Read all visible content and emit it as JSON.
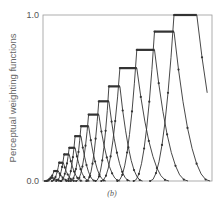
{
  "chart_data": {
    "type": "line",
    "title": "",
    "caption": "(b)",
    "xlabel": "",
    "ylabel": "Perceptual weighting functions",
    "ylim": [
      0.0,
      1.0
    ],
    "y_ticks": [
      "0.0",
      "1.0"
    ],
    "x_ticks": [],
    "grid": false,
    "legend": null,
    "series_description": "Family of 14 peaked weighting functions, each with a flat-top plateau, rising sharply on the left and decaying on the right; peak height increases with position",
    "series": [
      {
        "name": "band-1",
        "plateau": [
          0.045,
          0.06
        ],
        "peak": 0.02
      },
      {
        "name": "band-2",
        "plateau": [
          0.065,
          0.09
        ],
        "peak": 0.06
      },
      {
        "name": "band-3",
        "plateau": [
          0.095,
          0.12
        ],
        "peak": 0.11
      },
      {
        "name": "band-4",
        "plateau": [
          0.125,
          0.155
        ],
        "peak": 0.16
      },
      {
        "name": "band-5",
        "plateau": [
          0.155,
          0.19
        ],
        "peak": 0.2
      },
      {
        "name": "band-6",
        "plateau": [
          0.19,
          0.225
        ],
        "peak": 0.27
      },
      {
        "name": "band-7",
        "plateau": [
          0.225,
          0.27
        ],
        "peak": 0.33
      },
      {
        "name": "band-8",
        "plateau": [
          0.27,
          0.33
        ],
        "peak": 0.4
      },
      {
        "name": "band-9",
        "plateau": [
          0.33,
          0.39
        ],
        "peak": 0.48
      },
      {
        "name": "band-10",
        "plateau": [
          0.39,
          0.455
        ],
        "peak": 0.57
      },
      {
        "name": "band-11",
        "plateau": [
          0.455,
          0.555
        ],
        "peak": 0.68
      },
      {
        "name": "band-12",
        "plateau": [
          0.555,
          0.66
        ],
        "peak": 0.79
      },
      {
        "name": "band-13",
        "plateau": [
          0.66,
          0.775
        ],
        "peak": 0.9
      },
      {
        "name": "band-14",
        "plateau": [
          0.775,
          0.91
        ],
        "peak": 1.0
      }
    ],
    "colors": {
      "line": "#333333",
      "marker": "#333333",
      "axis": "#999999",
      "text": "#555555"
    }
  }
}
